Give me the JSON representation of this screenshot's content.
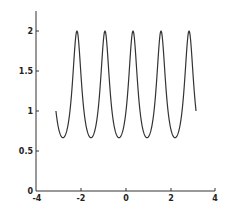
{
  "chart_data": {
    "type": "line",
    "title": "",
    "xlabel": "",
    "ylabel": "",
    "xlim": [
      -4,
      4
    ],
    "ylim": [
      0,
      2.25
    ],
    "grid": false,
    "legend": null,
    "x_ticks": [
      "-4",
      "-2",
      "0",
      "2",
      "4"
    ],
    "y_ticks": [
      "0",
      "0.5",
      "1",
      "1.5",
      "2"
    ],
    "series": [
      {
        "name": "f(x) = 1/(1 - 0.5*sin(5x))",
        "x": [
          -3.1416,
          -2.8274,
          -2.5133,
          -2.1991,
          -1.885,
          -1.5708,
          -1.2566,
          -0.9425,
          -0.6283,
          -0.3142,
          0,
          0.3142,
          0.6283,
          0.9425,
          1.2566,
          1.5708,
          1.885,
          2.1991,
          2.5133,
          2.8274,
          3.1416
        ],
        "values": [
          1.0,
          2.0,
          1.0,
          0.667,
          1.0,
          2.0,
          1.0,
          0.667,
          1.0,
          2.0,
          1.0,
          2.0,
          1.0,
          0.667,
          1.0,
          2.0,
          1.0,
          0.667,
          1.0,
          2.0,
          1.0
        ],
        "domain": [
          -3.1416,
          3.1416
        ],
        "min": 0.667,
        "max": 2.0,
        "peaks_x": [
          -2.83,
          -1.57,
          -0.31,
          0.94,
          2.2
        ],
        "color": "#333333"
      }
    ]
  },
  "axes": {
    "x_tick_labels": [
      "-4",
      "-2",
      "0",
      "2",
      "4"
    ],
    "y_tick_labels": [
      "0",
      "0.5",
      "1",
      "1.5",
      "2"
    ]
  }
}
